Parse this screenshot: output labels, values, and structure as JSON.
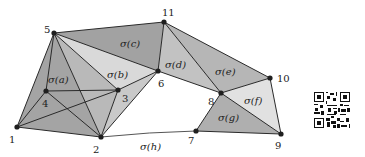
{
  "diagram": {
    "vertices": [
      {
        "id": "1",
        "x": 17,
        "y": 127,
        "label_dx": -8,
        "label_dy": 16
      },
      {
        "id": "2",
        "x": 101,
        "y": 137,
        "label_dx": -8,
        "label_dy": 16
      },
      {
        "id": "3",
        "x": 118,
        "y": 90,
        "label_dx": 4,
        "label_dy": 12
      },
      {
        "id": "4",
        "x": 46,
        "y": 91,
        "label_dx": -4,
        "label_dy": 16
      },
      {
        "id": "5",
        "x": 54,
        "y": 33,
        "label_dx": -10,
        "label_dy": 0
      },
      {
        "id": "6",
        "x": 158,
        "y": 71,
        "label_dx": 0,
        "label_dy": 16
      },
      {
        "id": "7",
        "x": 196,
        "y": 131,
        "label_dx": -8,
        "label_dy": 13
      },
      {
        "id": "8",
        "x": 221,
        "y": 93,
        "label_dx": -13,
        "label_dy": 12
      },
      {
        "id": "9",
        "x": 281,
        "y": 134,
        "label_dx": -6,
        "label_dy": 15
      },
      {
        "id": "10",
        "x": 270,
        "y": 78,
        "label_dx": 7,
        "label_dy": 4
      },
      {
        "id": "11",
        "x": 164,
        "y": 22,
        "label_dx": -2,
        "label_dy": -6
      }
    ],
    "faces": [
      {
        "name": "a",
        "points": "17,127 54,33 101,137",
        "fill": "#9c9c9c"
      },
      {
        "name": "a2",
        "points": "54,33 118,90 101,137",
        "fill": "#b3b3b3"
      },
      {
        "name": "b",
        "points": "54,33 158,71 118,90",
        "fill": "#d6d6d6"
      },
      {
        "name": "b2",
        "points": "118,90 158,71 101,137",
        "fill": "#c4c4c4"
      },
      {
        "name": "c",
        "points": "54,33 164,22 158,71",
        "fill": "#9a9a9a"
      },
      {
        "name": "d",
        "points": "164,22 221,93 158,71",
        "fill": "#bdbdbd"
      },
      {
        "name": "e",
        "points": "164,22 270,78 221,93",
        "fill": "#b0b0b0"
      },
      {
        "name": "f",
        "points": "221,93 270,78 281,134",
        "fill": "#dedede"
      },
      {
        "name": "g",
        "points": "221,93 281,134 196,131",
        "fill": "#a8a8a8"
      }
    ],
    "edges": [
      [
        17,
        127,
        54,
        33
      ],
      [
        17,
        127,
        101,
        137
      ],
      [
        54,
        33,
        101,
        137
      ],
      [
        17,
        127,
        118,
        90
      ],
      [
        17,
        127,
        46,
        91
      ],
      [
        46,
        91,
        54,
        33
      ],
      [
        46,
        91,
        118,
        90
      ],
      [
        46,
        91,
        101,
        137
      ],
      [
        54,
        33,
        118,
        90
      ],
      [
        118,
        90,
        101,
        137
      ],
      [
        54,
        33,
        158,
        71
      ],
      [
        118,
        90,
        158,
        71
      ],
      [
        101,
        137,
        158,
        71
      ],
      [
        54,
        33,
        164,
        22
      ],
      [
        164,
        22,
        158,
        71
      ],
      [
        164,
        22,
        221,
        93
      ],
      [
        158,
        71,
        221,
        93
      ],
      [
        164,
        22,
        270,
        78
      ],
      [
        270,
        78,
        221,
        93
      ],
      [
        270,
        78,
        281,
        134
      ],
      [
        221,
        93,
        281,
        134
      ],
      [
        221,
        93,
        196,
        131
      ],
      [
        196,
        131,
        281,
        134
      ]
    ],
    "curve_h": "M101,137 Q150,132 196,131",
    "simplex_labels": [
      {
        "text": "σ(a)",
        "x": 48,
        "y": 83
      },
      {
        "text": "σ(b)",
        "x": 107,
        "y": 78
      },
      {
        "text": "σ(c)",
        "x": 120,
        "y": 47
      },
      {
        "text": "σ(d)",
        "x": 165,
        "y": 68
      },
      {
        "text": "σ(e)",
        "x": 215,
        "y": 75
      },
      {
        "text": "σ(f)",
        "x": 244,
        "y": 104
      },
      {
        "text": "σ(g)",
        "x": 218,
        "y": 121
      },
      {
        "text": "σ(h)",
        "x": 140,
        "y": 150
      }
    ],
    "colors": {
      "edge": "#2a2a2a",
      "vertex": "#1f1f1f",
      "curve": "#555555"
    }
  },
  "qr": {
    "label": "qr-code"
  }
}
